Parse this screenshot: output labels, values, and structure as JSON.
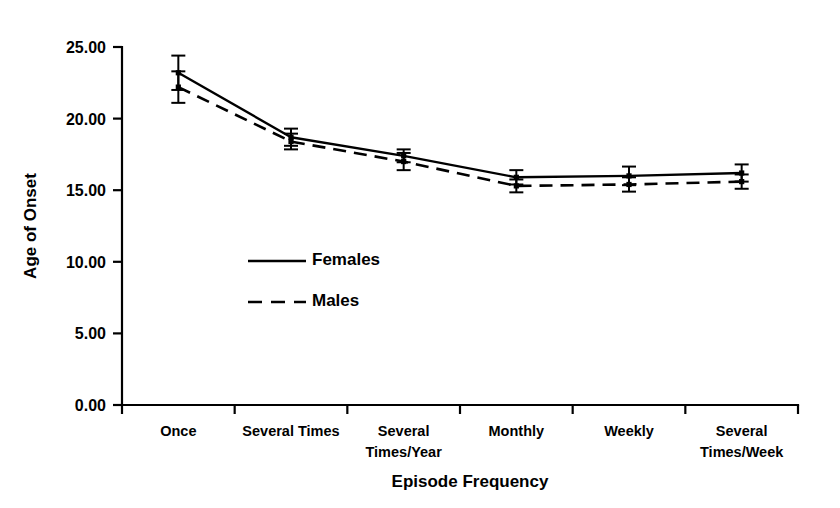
{
  "chart_data": {
    "type": "line",
    "title": "",
    "xlabel": "Episode Frequency",
    "ylabel": "Age of Onset",
    "categories": [
      "Once",
      "Several Times",
      "Several\nTimes/Year",
      "Monthly",
      "Weekly",
      "Several\nTimes/Week"
    ],
    "category_lines": [
      [
        "Once"
      ],
      [
        "Several Times"
      ],
      [
        "Several",
        "Times/Year"
      ],
      [
        "Monthly"
      ],
      [
        "Weekly"
      ],
      [
        "Several",
        "Times/Week"
      ]
    ],
    "ylim": [
      0,
      25
    ],
    "ytick_values": [
      0,
      5,
      10,
      15,
      20,
      25
    ],
    "ytick_labels": [
      "0.00",
      "5.00",
      "10.00",
      "15.00",
      "20.00",
      "25.00"
    ],
    "grid": false,
    "legend_position": "center-left",
    "series": [
      {
        "name": "Females",
        "style": "solid",
        "values": [
          23.2,
          18.7,
          17.4,
          15.9,
          16.0,
          16.2
        ],
        "errors": [
          1.2,
          0.6,
          0.45,
          0.5,
          0.65,
          0.6
        ]
      },
      {
        "name": "Males",
        "style": "dashed",
        "values": [
          22.2,
          18.4,
          17.0,
          15.3,
          15.4,
          15.6
        ],
        "errors": [
          1.1,
          0.55,
          0.6,
          0.45,
          0.5,
          0.5
        ]
      }
    ],
    "colors": {
      "series": "#000000",
      "axis": "#000000",
      "background": "#ffffff"
    }
  },
  "legend": {
    "items": [
      {
        "label": "Females",
        "style": "solid"
      },
      {
        "label": "Males",
        "style": "dashed"
      }
    ]
  },
  "axes": {
    "y_title": "Age of Onset",
    "x_title": "Episode Frequency"
  }
}
